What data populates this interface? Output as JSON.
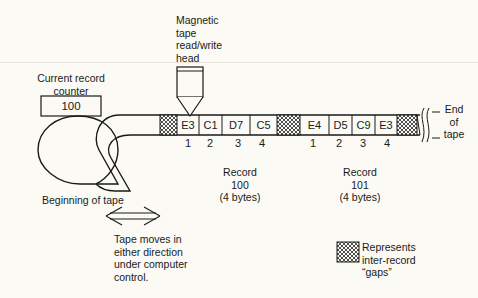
{
  "head_label": [
    "Magnetic",
    "tape",
    "read/write",
    "head"
  ],
  "counter": {
    "label": [
      "Current record",
      "counter"
    ],
    "value": "100"
  },
  "end_of_tape": [
    "End",
    "of",
    "tape"
  ],
  "beginning_of_tape": "Beginning of tape",
  "tape": {
    "cells": [
      {
        "type": "gap"
      },
      {
        "type": "byte",
        "value": "E3",
        "index": "1"
      },
      {
        "type": "byte",
        "value": "C1",
        "index": "2"
      },
      {
        "type": "byte",
        "value": "D7",
        "index": "3"
      },
      {
        "type": "byte",
        "value": "C5",
        "index": "4"
      },
      {
        "type": "gap"
      },
      {
        "type": "byte",
        "value": "E4",
        "index": "1"
      },
      {
        "type": "byte",
        "value": "D5",
        "index": "2"
      },
      {
        "type": "byte",
        "value": "C9",
        "index": "3"
      },
      {
        "type": "byte",
        "value": "E3",
        "index": "4"
      },
      {
        "type": "gap"
      }
    ]
  },
  "records": [
    {
      "label": "Record",
      "number": "100",
      "size": "(4 bytes)"
    },
    {
      "label": "Record",
      "number": "101",
      "size": "(4 bytes)"
    }
  ],
  "movement_note": [
    "Tape moves in",
    "either direction",
    "under computer",
    "control."
  ],
  "legend": {
    "label": [
      "Represents",
      "inter-record",
      "“gaps”"
    ]
  }
}
